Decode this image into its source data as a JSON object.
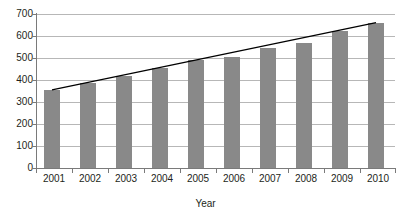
{
  "chart_data": {
    "type": "bar",
    "title": "",
    "subtitle": "",
    "xlabel": "Year",
    "ylabel": "",
    "categories": [
      "2001",
      "2002",
      "2003",
      "2004",
      "2005",
      "2006",
      "2007",
      "2008",
      "2009",
      "2010"
    ],
    "values": [
      355,
      385,
      420,
      455,
      490,
      505,
      545,
      570,
      625,
      660
    ],
    "series": [
      {
        "name": "Value",
        "type": "bar",
        "values": [
          355,
          385,
          420,
          455,
          490,
          505,
          545,
          570,
          625,
          660
        ],
        "color": "#898989"
      },
      {
        "name": "Trendline",
        "type": "line",
        "values": [
          355,
          389,
          423,
          457,
          491,
          525,
          559,
          593,
          627,
          661
        ],
        "color": "#000000"
      }
    ],
    "ylim": [
      0,
      700
    ],
    "yticks": [
      0,
      100,
      200,
      300,
      400,
      500,
      600,
      700
    ],
    "ytick_labels": [
      "0",
      "100",
      "200",
      "300",
      "400",
      "500",
      "600",
      "700"
    ],
    "grid": true,
    "grid_axis": "y",
    "legend": false,
    "legend_position": "none",
    "trendline": true,
    "annotations": []
  }
}
